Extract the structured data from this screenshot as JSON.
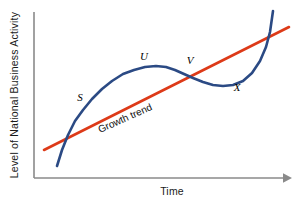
{
  "chart_data": {
    "type": "line",
    "title": "",
    "xlabel": "Time",
    "ylabel": "Level of National Business Activity",
    "grid": false,
    "legend": "none",
    "axis_ticks": false,
    "annotations": [
      {
        "text": "S",
        "role": "curve-phase-label",
        "x": 80,
        "y": 101
      },
      {
        "text": "U",
        "role": "curve-phase-label",
        "x": 144,
        "y": 60
      },
      {
        "text": "V",
        "role": "curve-phase-label",
        "x": 190,
        "y": 64
      },
      {
        "text": "X",
        "role": "curve-phase-label",
        "x": 237,
        "y": 91
      },
      {
        "text": "Growth trend",
        "role": "trend-line-label",
        "x": 100,
        "y": 133,
        "rotation": -24
      }
    ],
    "series": [
      {
        "name": "Business cycle curve",
        "color": "#2b4a84",
        "style": "solid",
        "width": 2.6,
        "points": [
          [
            57,
            166
          ],
          [
            62,
            150
          ],
          [
            68,
            135
          ],
          [
            75,
            121
          ],
          [
            83,
            110
          ],
          [
            92,
            99
          ],
          [
            102,
            89
          ],
          [
            112,
            81
          ],
          [
            123,
            74
          ],
          [
            134,
            70
          ],
          [
            145,
            67
          ],
          [
            156,
            66
          ],
          [
            166,
            67
          ],
          [
            175,
            70
          ],
          [
            184,
            74
          ],
          [
            193,
            78
          ],
          [
            203,
            82
          ],
          [
            213,
            85
          ],
          [
            223,
            86
          ],
          [
            233,
            85
          ],
          [
            243,
            81
          ],
          [
            252,
            73
          ],
          [
            260,
            61
          ],
          [
            266,
            47
          ],
          [
            270,
            32
          ],
          [
            272,
            18
          ],
          [
            273,
            11
          ]
        ]
      },
      {
        "name": "Growth trend",
        "color": "#dd3a18",
        "style": "solid",
        "width": 2.6,
        "points": [
          [
            44,
            150
          ],
          [
            289,
            27
          ]
        ]
      }
    ],
    "axes": {
      "color": "#8a8a8a",
      "origin": [
        34,
        178
      ],
      "y_top": [
        34,
        12
      ],
      "x_right": [
        288,
        178
      ],
      "x_arrow": true
    }
  }
}
